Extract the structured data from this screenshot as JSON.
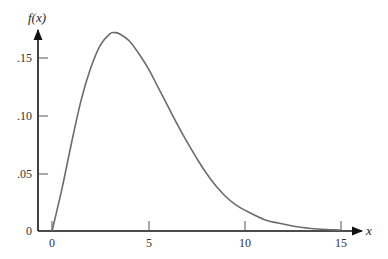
{
  "chart_data": {
    "type": "line",
    "title": "",
    "xlabel": "x",
    "ylabel": "f(x)",
    "xlim": [
      0,
      15.5
    ],
    "ylim": [
      0,
      0.18
    ],
    "grid": false,
    "legend": null,
    "x_ticks": [
      0,
      5,
      10,
      15
    ],
    "x_tick_labels": [
      "0",
      "5",
      "10",
      "15"
    ],
    "y_ticks": [
      0,
      0.05,
      0.1,
      0.15
    ],
    "y_tick_labels": [
      "0",
      ".05",
      ".10",
      ".15"
    ],
    "series": [
      {
        "name": "f(x)",
        "color": "#6b6b6b",
        "x": [
          0,
          0.5,
          1,
          1.5,
          2,
          2.5,
          3,
          3.25,
          3.5,
          4,
          4.5,
          5,
          5.5,
          6,
          6.5,
          7,
          7.5,
          8,
          8.5,
          9,
          9.5,
          10,
          11,
          12,
          13,
          14,
          15
        ],
        "y": [
          0,
          0.035,
          0.075,
          0.112,
          0.14,
          0.16,
          0.17,
          0.171,
          0.17,
          0.164,
          0.153,
          0.14,
          0.124,
          0.108,
          0.092,
          0.077,
          0.063,
          0.05,
          0.039,
          0.03,
          0.023,
          0.018,
          0.01,
          0.006,
          0.003,
          0.0015,
          0.0008
        ]
      }
    ]
  },
  "axes": {
    "y_title": "f(x)",
    "x_title": "x",
    "y_tick_labels": [
      ".15",
      ".10",
      ".05",
      "0"
    ],
    "x_tick_labels": [
      "0",
      "5",
      "10",
      "15"
    ]
  }
}
